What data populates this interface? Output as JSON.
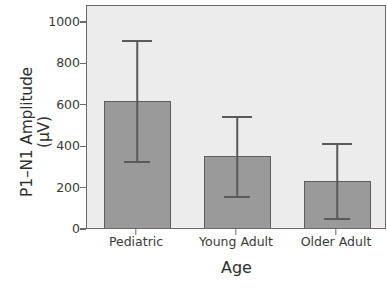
{
  "chart_data": {
    "type": "bar",
    "title": "",
    "xlabel": "Age",
    "ylabel_line1": "P1–N1 Amplitude",
    "ylabel_line2": "(μV)",
    "categories": [
      "Pediatric",
      "Young Adult",
      "Older Adult"
    ],
    "values": [
      623,
      357,
      237
    ],
    "error_low": [
      329,
      159,
      53
    ],
    "error_high": [
      913,
      546,
      415
    ],
    "yticks": [
      0,
      200,
      400,
      600,
      800,
      1000
    ],
    "ytick_labels": [
      "0",
      "200",
      "400",
      "600",
      "800",
      "1000"
    ],
    "ylim": [
      0,
      1080
    ],
    "grid": false,
    "legend": "none",
    "bar_color": "#9a9a9a",
    "bar_edge_color": "#5d5d5d",
    "error_bar_color": "#5a5a5a",
    "panel_background": "#ececec",
    "panel_border_color": "#6a6a6a",
    "text_color": "#3a3a3a"
  }
}
